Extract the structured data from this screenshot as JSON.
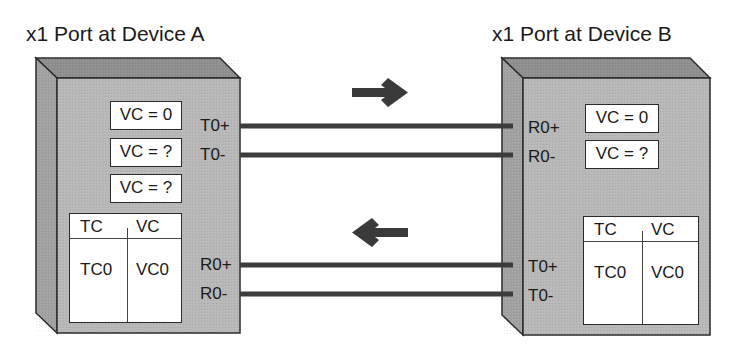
{
  "device_a": {
    "title": "x1 Port at Device A",
    "vc_buffers": [
      "VC = 0",
      "VC = ?",
      "VC = ?"
    ],
    "tx_labels": [
      "T0+",
      "T0-"
    ],
    "rx_labels": [
      "R0+",
      "R0-"
    ],
    "map_table": {
      "headers": [
        "TC",
        "VC"
      ],
      "rows": [
        [
          "TC0",
          "VC0"
        ]
      ]
    }
  },
  "device_b": {
    "title": "x1 Port at Device B",
    "vc_buffers": [
      "VC = 0",
      "VC = ?"
    ],
    "rx_labels": [
      "R0+",
      "R0-"
    ],
    "tx_labels": [
      "T0+",
      "T0-"
    ],
    "map_table": {
      "headers": [
        "TC",
        "VC"
      ],
      "rows": [
        [
          "TC0",
          "VC0"
        ]
      ]
    }
  },
  "arrows": {
    "top": "right-arrow-icon",
    "bottom": "left-arrow-icon"
  },
  "colors": {
    "device_face": "#b8b8b8",
    "device_side": "#a2a2a2",
    "device_top": "#8f8f8f",
    "outline": "#2a2a2a",
    "link": "#3c3c3c",
    "arrow": "#3a3a3a"
  }
}
